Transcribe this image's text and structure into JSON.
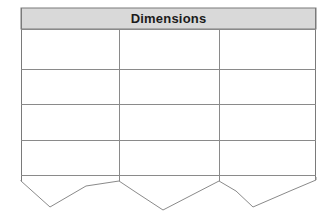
{
  "canvas": {
    "width": 335,
    "height": 220,
    "background_color": "#ffffff"
  },
  "table": {
    "title": "Dimensions",
    "header_fill_color": "#d9d9d9",
    "header_text_color": "#1b1b1b",
    "border_color": "#7a7a7a",
    "grid_line_color": "#8a8a8a",
    "body_fill_color": "#ffffff",
    "bounds": {
      "left": 21,
      "right": 316,
      "top": 8,
      "header_bottom": 29,
      "body_bottom": 175
    },
    "column_divider_x": [
      119,
      219
    ],
    "row_line_y": [
      29,
      69,
      104,
      140,
      175
    ],
    "columns": [
      {
        "name": "column-1",
        "header": "",
        "cells": [
          "",
          "",
          "",
          ""
        ]
      },
      {
        "name": "column-2",
        "header": "",
        "cells": [
          "",
          "",
          "",
          ""
        ]
      },
      {
        "name": "column-3",
        "header": "",
        "cells": [
          "",
          "",
          "",
          ""
        ]
      }
    ],
    "row_count": 4,
    "column_count": 3,
    "torn_edge": {
      "description": "zigzag torn paper bottom edge",
      "points": "21,180 21,181 50,207 86,186 119,181 137,193 163,210 190,196 219,181 236,191 253,207 290,191 316,180 316,177"
    }
  }
}
